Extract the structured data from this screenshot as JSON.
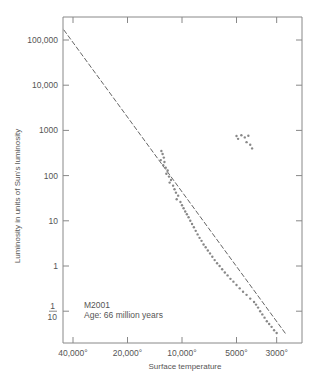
{
  "chart_data": {
    "type": "scatter",
    "title": "",
    "xlabel": "Surface temperature",
    "ylabel": "Luminosity in units of Sun's luminosity",
    "x_scale": "log-reversed",
    "y_scale": "log",
    "x_ticks": [
      {
        "value": 40000,
        "label": "40,000°"
      },
      {
        "value": 20000,
        "label": "20,000°"
      },
      {
        "value": 10000,
        "label": "10,000°"
      },
      {
        "value": 5000,
        "label": "5000°"
      },
      {
        "value": 3000,
        "label": "3000°"
      }
    ],
    "y_ticks": [
      {
        "value": 100000,
        "label": "100,000"
      },
      {
        "value": 10000,
        "label": "10,000"
      },
      {
        "value": 1000,
        "label": "1000"
      },
      {
        "value": 100,
        "label": "100"
      },
      {
        "value": 10,
        "label": "10"
      },
      {
        "value": 1,
        "label": "1"
      },
      {
        "value": 0.1,
        "label": "1/10"
      }
    ],
    "ylim": [
      0.03,
      300000
    ],
    "xlim": [
      50000,
      2300
    ],
    "grid": false,
    "annotation": {
      "cluster": "M2001",
      "age": "Age: 66 million years"
    },
    "series": [
      {
        "name": "Main sequence reference line",
        "kind": "dashed-line",
        "points": [
          [
            50000,
            300000
          ],
          [
            2650,
            0.03
          ]
        ]
      },
      {
        "name": "Upper main-sequence turnoff stars",
        "kind": "points",
        "points": [
          [
            13000,
            350
          ],
          [
            12800,
            300
          ],
          [
            12600,
            250
          ],
          [
            13100,
            220
          ],
          [
            12500,
            200
          ],
          [
            12700,
            170
          ],
          [
            12300,
            150
          ],
          [
            12000,
            130
          ],
          [
            12200,
            110
          ],
          [
            11800,
            95
          ],
          [
            11500,
            80
          ],
          [
            11700,
            70
          ],
          [
            11200,
            60
          ],
          [
            11000,
            50
          ],
          [
            10800,
            42
          ],
          [
            10500,
            36
          ],
          [
            10700,
            30
          ],
          [
            10200,
            26
          ],
          [
            10000,
            22
          ],
          [
            9800,
            19
          ],
          [
            9600,
            16
          ],
          [
            9400,
            14
          ],
          [
            9200,
            12
          ],
          [
            9000,
            10
          ],
          [
            8800,
            8.5
          ],
          [
            8600,
            7.2
          ],
          [
            8400,
            6
          ],
          [
            8200,
            5
          ],
          [
            8000,
            4.2
          ],
          [
            7800,
            3.6
          ],
          [
            7600,
            3
          ],
          [
            7400,
            2.6
          ],
          [
            7200,
            2.2
          ],
          [
            7000,
            1.9
          ]
        ]
      },
      {
        "name": "Lower main sequence",
        "kind": "points",
        "points": [
          [
            6800,
            1.6
          ],
          [
            6600,
            1.35
          ],
          [
            6400,
            1.15
          ],
          [
            6200,
            1.0
          ],
          [
            6000,
            0.85
          ],
          [
            5800,
            0.72
          ],
          [
            5600,
            0.62
          ],
          [
            5400,
            0.52
          ],
          [
            5200,
            0.45
          ],
          [
            5000,
            0.38
          ],
          [
            4800,
            0.32
          ],
          [
            4600,
            0.27
          ],
          [
            4400,
            0.23
          ],
          [
            4200,
            0.19
          ],
          [
            4000,
            0.16
          ],
          [
            3900,
            0.14
          ],
          [
            3800,
            0.12
          ],
          [
            3700,
            0.1
          ],
          [
            3600,
            0.085
          ],
          [
            3500,
            0.072
          ],
          [
            3400,
            0.06
          ],
          [
            3300,
            0.052
          ],
          [
            3200,
            0.045
          ],
          [
            3100,
            0.038
          ],
          [
            3000,
            0.033
          ]
        ]
      },
      {
        "name": "Red giants",
        "kind": "points",
        "points": [
          [
            5000,
            750
          ],
          [
            4900,
            650
          ],
          [
            4700,
            780
          ],
          [
            4500,
            700
          ],
          [
            4300,
            760
          ],
          [
            4400,
            550
          ],
          [
            4200,
            480
          ],
          [
            4100,
            400
          ]
        ]
      }
    ]
  }
}
